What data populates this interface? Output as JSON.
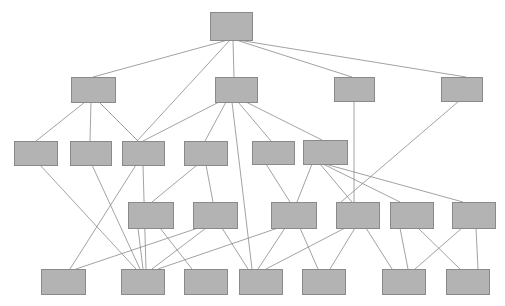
{
  "diagram": {
    "type": "layered-graph",
    "width": 505,
    "height": 306,
    "background_color": "#ffffff",
    "node_style": {
      "fill_color": "#b3b3b3",
      "stroke_color": "#8a8a8a",
      "stroke_width": 1
    },
    "edge_style": {
      "stroke_color": "#8a8a8a",
      "stroke_width": 0.8
    },
    "layers": [
      {
        "name": "layer-1",
        "node_count": 1
      },
      {
        "name": "layer-2",
        "node_count": 4
      },
      {
        "name": "layer-3",
        "node_count": 6
      },
      {
        "name": "layer-4",
        "node_count": 6
      },
      {
        "name": "layer-5",
        "node_count": 7
      }
    ],
    "nodes": [
      {
        "id": "n1-1",
        "layer": 1,
        "x": 210,
        "y": 12,
        "w": 42,
        "h": 28
      },
      {
        "id": "n2-1",
        "layer": 2,
        "x": 71,
        "y": 77,
        "w": 44,
        "h": 25
      },
      {
        "id": "n2-2",
        "layer": 2,
        "x": 215,
        "y": 77,
        "w": 42,
        "h": 25
      },
      {
        "id": "n2-3",
        "layer": 2,
        "x": 334,
        "y": 77,
        "w": 40,
        "h": 24
      },
      {
        "id": "n2-4",
        "layer": 2,
        "x": 441,
        "y": 77,
        "w": 41,
        "h": 24
      },
      {
        "id": "n3-1",
        "layer": 3,
        "x": 14,
        "y": 141,
        "w": 43,
        "h": 24
      },
      {
        "id": "n3-2",
        "layer": 3,
        "x": 70,
        "y": 141,
        "w": 41,
        "h": 24
      },
      {
        "id": "n3-3",
        "layer": 3,
        "x": 122,
        "y": 141,
        "w": 42,
        "h": 24
      },
      {
        "id": "n3-4",
        "layer": 3,
        "x": 184,
        "y": 141,
        "w": 43,
        "h": 24
      },
      {
        "id": "n3-5",
        "layer": 3,
        "x": 252,
        "y": 141,
        "w": 42,
        "h": 23
      },
      {
        "id": "n3-6",
        "layer": 3,
        "x": 303,
        "y": 140,
        "w": 44,
        "h": 24
      },
      {
        "id": "n4-1",
        "layer": 4,
        "x": 128,
        "y": 202,
        "w": 45,
        "h": 26
      },
      {
        "id": "n4-2",
        "layer": 4,
        "x": 193,
        "y": 202,
        "w": 44,
        "h": 26
      },
      {
        "id": "n4-3",
        "layer": 4,
        "x": 271,
        "y": 202,
        "w": 45,
        "h": 26
      },
      {
        "id": "n4-4",
        "layer": 4,
        "x": 336,
        "y": 202,
        "w": 43,
        "h": 26
      },
      {
        "id": "n4-5",
        "layer": 4,
        "x": 390,
        "y": 202,
        "w": 43,
        "h": 26
      },
      {
        "id": "n4-6",
        "layer": 4,
        "x": 452,
        "y": 202,
        "w": 43,
        "h": 26
      },
      {
        "id": "n5-1",
        "layer": 5,
        "x": 41,
        "y": 269,
        "w": 44,
        "h": 25
      },
      {
        "id": "n5-2",
        "layer": 5,
        "x": 121,
        "y": 269,
        "w": 43,
        "h": 25
      },
      {
        "id": "n5-3",
        "layer": 5,
        "x": 184,
        "y": 269,
        "w": 43,
        "h": 25
      },
      {
        "id": "n5-4",
        "layer": 5,
        "x": 239,
        "y": 269,
        "w": 43,
        "h": 25
      },
      {
        "id": "n5-5",
        "layer": 5,
        "x": 302,
        "y": 269,
        "w": 43,
        "h": 25
      },
      {
        "id": "n5-6",
        "layer": 5,
        "x": 382,
        "y": 269,
        "w": 43,
        "h": 25
      },
      {
        "id": "n5-7",
        "layer": 5,
        "x": 446,
        "y": 269,
        "w": 43,
        "h": 25
      }
    ],
    "edges": [
      {
        "from": "n1-1",
        "to": "n2-1",
        "x1": 228,
        "y1": 40,
        "x2": 93,
        "y2": 77
      },
      {
        "from": "n1-1",
        "to": "n3-3",
        "x1": 230,
        "y1": 40,
        "x2": 137,
        "y2": 141
      },
      {
        "from": "n1-1",
        "to": "n2-2",
        "x1": 233,
        "y1": 40,
        "x2": 234,
        "y2": 77
      },
      {
        "from": "n1-1",
        "to": "n2-3",
        "x1": 236,
        "y1": 40,
        "x2": 352,
        "y2": 77
      },
      {
        "from": "n1-1",
        "to": "n2-4",
        "x1": 238,
        "y1": 40,
        "x2": 466,
        "y2": 77
      },
      {
        "from": "n2-1",
        "to": "n3-1",
        "x1": 85,
        "y1": 102,
        "x2": 36,
        "y2": 141
      },
      {
        "from": "n2-1",
        "to": "n3-2",
        "x1": 91,
        "y1": 102,
        "x2": 90,
        "y2": 141
      },
      {
        "from": "n2-1",
        "to": "n3-3",
        "x1": 99,
        "y1": 102,
        "x2": 138,
        "y2": 141
      },
      {
        "from": "n2-2",
        "to": "n3-3",
        "x1": 219,
        "y1": 102,
        "x2": 143,
        "y2": 141
      },
      {
        "from": "n2-2",
        "to": "n3-4",
        "x1": 226,
        "y1": 102,
        "x2": 205,
        "y2": 141
      },
      {
        "from": "n2-2",
        "to": "n5-4",
        "x1": 232,
        "y1": 102,
        "x2": 252,
        "y2": 269
      },
      {
        "from": "n2-2",
        "to": "n3-5",
        "x1": 238,
        "y1": 102,
        "x2": 271,
        "y2": 141
      },
      {
        "from": "n2-2",
        "to": "n3-6",
        "x1": 246,
        "y1": 102,
        "x2": 322,
        "y2": 140
      },
      {
        "from": "n2-3",
        "to": "n4-4",
        "x1": 354,
        "y1": 101,
        "x2": 354,
        "y2": 202
      },
      {
        "from": "n2-4",
        "to": "n4-4",
        "x1": 459,
        "y1": 101,
        "x2": 341,
        "y2": 202
      },
      {
        "from": "n3-1",
        "to": "n5-2",
        "x1": 40,
        "y1": 165,
        "x2": 136,
        "y2": 269
      },
      {
        "from": "n3-2",
        "to": "n5-2",
        "x1": 92,
        "y1": 165,
        "x2": 140,
        "y2": 269
      },
      {
        "from": "n3-3",
        "to": "n5-1",
        "x1": 136,
        "y1": 165,
        "x2": 70,
        "y2": 269
      },
      {
        "from": "n3-3",
        "to": "n5-2",
        "x1": 143,
        "y1": 165,
        "x2": 146,
        "y2": 269
      },
      {
        "from": "n3-4",
        "to": "n4-1",
        "x1": 197,
        "y1": 165,
        "x2": 152,
        "y2": 202
      },
      {
        "from": "n3-4",
        "to": "n4-2",
        "x1": 206,
        "y1": 165,
        "x2": 213,
        "y2": 202
      },
      {
        "from": "n3-5",
        "to": "n4-3",
        "x1": 266,
        "y1": 164,
        "x2": 290,
        "y2": 202
      },
      {
        "from": "n3-6",
        "to": "n4-3",
        "x1": 312,
        "y1": 164,
        "x2": 297,
        "y2": 202
      },
      {
        "from": "n3-6",
        "to": "n4-4",
        "x1": 320,
        "y1": 164,
        "x2": 352,
        "y2": 202
      },
      {
        "from": "n3-6",
        "to": "n4-5",
        "x1": 323,
        "y1": 164,
        "x2": 400,
        "y2": 202
      },
      {
        "from": "n3-6",
        "to": "n4-6",
        "x1": 325,
        "y1": 164,
        "x2": 463,
        "y2": 202
      },
      {
        "from": "n4-1",
        "to": "n5-2",
        "x1": 138,
        "y1": 228,
        "x2": 143,
        "y2": 269
      },
      {
        "from": "n4-1",
        "to": "n5-3",
        "x1": 160,
        "y1": 228,
        "x2": 192,
        "y2": 269
      },
      {
        "from": "n4-2",
        "to": "n5-1",
        "x1": 198,
        "y1": 228,
        "x2": 76,
        "y2": 269
      },
      {
        "from": "n4-2",
        "to": "n5-2",
        "x1": 206,
        "y1": 228,
        "x2": 152,
        "y2": 269
      },
      {
        "from": "n4-2",
        "to": "n5-4",
        "x1": 222,
        "y1": 228,
        "x2": 248,
        "y2": 269
      },
      {
        "from": "n4-3",
        "to": "n5-2",
        "x1": 278,
        "y1": 228,
        "x2": 158,
        "y2": 269
      },
      {
        "from": "n4-3",
        "to": "n5-4",
        "x1": 285,
        "y1": 228,
        "x2": 258,
        "y2": 269
      },
      {
        "from": "n4-3",
        "to": "n5-5",
        "x1": 300,
        "y1": 228,
        "x2": 318,
        "y2": 269
      },
      {
        "from": "n4-4",
        "to": "n5-4",
        "x1": 345,
        "y1": 228,
        "x2": 266,
        "y2": 269
      },
      {
        "from": "n4-4",
        "to": "n5-5",
        "x1": 355,
        "y1": 228,
        "x2": 330,
        "y2": 269
      },
      {
        "from": "n4-4",
        "to": "n5-6",
        "x1": 366,
        "y1": 228,
        "x2": 392,
        "y2": 269
      },
      {
        "from": "n4-5",
        "to": "n5-6",
        "x1": 400,
        "y1": 228,
        "x2": 408,
        "y2": 269
      },
      {
        "from": "n4-5",
        "to": "n5-7",
        "x1": 418,
        "y1": 228,
        "x2": 460,
        "y2": 269
      },
      {
        "from": "n4-6",
        "to": "n5-6",
        "x1": 462,
        "y1": 228,
        "x2": 415,
        "y2": 269
      },
      {
        "from": "n4-6",
        "to": "n5-7",
        "x1": 476,
        "y1": 228,
        "x2": 478,
        "y2": 269
      }
    ]
  }
}
